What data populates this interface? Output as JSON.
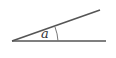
{
  "diagram": {
    "type": "angle",
    "angle_label": "a",
    "vertex": [
      12,
      41
    ],
    "ray_lower_end": [
      106,
      41
    ],
    "ray_upper_end": [
      100,
      10
    ],
    "line_color": "#555555"
  }
}
